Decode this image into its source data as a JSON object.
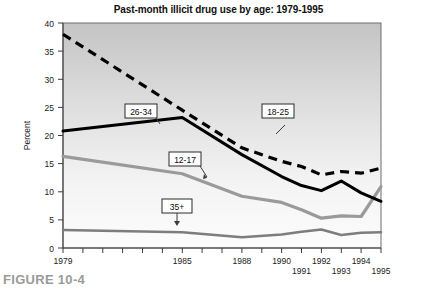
{
  "figure": {
    "caption": "FIGURE 10-4"
  },
  "chart_data": {
    "type": "line",
    "title": "Past-month illicit drug use by age: 1979-1995",
    "xlabel": "",
    "ylabel": "Percent",
    "ylim": [
      0,
      40
    ],
    "yticks": [
      0,
      5,
      10,
      15,
      20,
      25,
      30,
      35,
      40
    ],
    "ytick_labels": [
      "0",
      "5",
      "10",
      "15",
      "20",
      "25",
      "30",
      "35",
      "40"
    ],
    "xlim": [
      1979,
      1995
    ],
    "x": [
      1979,
      1985,
      1988,
      1990,
      1991,
      1992,
      1993,
      1994,
      1995
    ],
    "xticks": [
      1979,
      1980,
      1981,
      1982,
      1983,
      1984,
      1985,
      1986,
      1987,
      1988,
      1989,
      1990,
      1991,
      1992,
      1993,
      1994,
      1995
    ],
    "xtick_labels_upper": [
      "1979",
      "1985",
      "1988",
      "1990",
      "1992",
      "1994"
    ],
    "xtick_labels_lower": [
      "1991",
      "1993",
      "1995"
    ],
    "xtick_labels_all": [
      "1979",
      "1985",
      "1988",
      "1990",
      "1991",
      "1992",
      "1993",
      "1994",
      "1995"
    ],
    "grid": false,
    "legend_position": "inline-callouts",
    "series": [
      {
        "name": "18-25",
        "label": "18-25",
        "style": "dashed",
        "color": "#000000",
        "values": [
          38.0,
          24.5,
          17.8,
          15.4,
          14.5,
          13.0,
          13.6,
          13.3,
          14.2
        ]
      },
      {
        "name": "26-34",
        "label": "26-34",
        "style": "solid-bold",
        "color": "#000000",
        "values": [
          20.8,
          23.2,
          16.6,
          12.7,
          11.1,
          10.2,
          11.9,
          9.8,
          8.3
        ]
      },
      {
        "name": "12-17",
        "label": "12-17",
        "style": "solid-medium",
        "color": "#9a9a9a",
        "values": [
          16.3,
          13.2,
          9.2,
          8.1,
          6.8,
          5.3,
          5.7,
          5.6,
          10.9
        ]
      },
      {
        "name": "35+",
        "label": "35+",
        "style": "solid-thin",
        "color": "#7d7d7d",
        "values": [
          3.2,
          2.8,
          1.9,
          2.4,
          2.9,
          3.3,
          2.3,
          2.7,
          2.8
        ]
      }
    ],
    "annotations": [
      {
        "text": "26-34",
        "series": "26-34"
      },
      {
        "text": "18-25",
        "series": "18-25"
      },
      {
        "text": "12-17",
        "series": "12-17"
      },
      {
        "text": "35+",
        "series": "35+"
      }
    ],
    "colors": {
      "plot_bg_top": "#c6c6c6",
      "plot_bg_bottom": "#fafafa",
      "axis": "#3c3c3c"
    }
  }
}
